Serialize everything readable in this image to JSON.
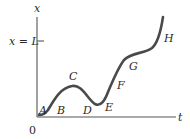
{
  "diagram": {
    "axes": {
      "y_label": "x",
      "x_label": "t",
      "origin_label": "0",
      "tick_label": "x = L"
    },
    "points": [
      {
        "id": "A",
        "label": "A"
      },
      {
        "id": "B",
        "label": "B"
      },
      {
        "id": "C",
        "label": "C"
      },
      {
        "id": "D",
        "label": "D"
      },
      {
        "id": "E",
        "label": "E"
      },
      {
        "id": "F",
        "label": "F"
      },
      {
        "id": "G",
        "label": "G"
      },
      {
        "id": "H",
        "label": "H"
      }
    ],
    "colors": {
      "axis": "#555555",
      "curve": "#4a4a4a",
      "text": "#2a2a2a"
    }
  }
}
